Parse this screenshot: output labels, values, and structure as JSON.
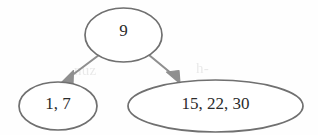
{
  "figure": {
    "type": "tree-diagram",
    "background_color": "#fefefe",
    "stroke_color": "#6f6f6f",
    "text_color": "#2b2b2b",
    "arrow_color": "#8a8a8a"
  },
  "nodes": {
    "root": {
      "label": "9",
      "cx": 123.5,
      "cy": 35,
      "rx": 38.5,
      "ry": 27
    },
    "left_child": {
      "label": "1, 7",
      "cx": 58,
      "cy": 106,
      "rx": 39,
      "ry": 24
    },
    "right_child": {
      "label": "15, 22, 30",
      "cx": 215.5,
      "cy": 106,
      "rx": 87.5,
      "ry": 26
    }
  },
  "edges": [
    {
      "name": "root-to-left",
      "from": "root",
      "to": "left_child",
      "arrowhead": "filled-triangle"
    },
    {
      "name": "root-to-right",
      "from": "root",
      "to": "right_child",
      "arrowhead": "filled-triangle"
    }
  ],
  "artifacts": {
    "bleed_through_1": "nuz",
    "bleed_through_2": "h-"
  }
}
